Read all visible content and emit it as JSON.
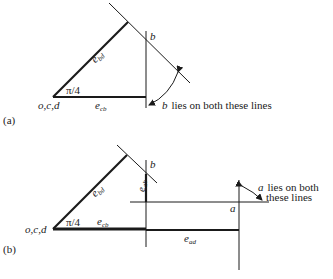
{
  "diagram_a": {
    "panel_label": "(a)",
    "origin_label": "o,c,d",
    "angle_label": "π/4",
    "e_bd": {
      "base": "e",
      "sub": "bd"
    },
    "e_cb": {
      "base": "e",
      "sub": "cb"
    },
    "point_b_label": "b",
    "note_var": "b",
    "note_text": "lies on both these lines"
  },
  "diagram_b": {
    "panel_label": "(b)",
    "origin_label": "o,c,d",
    "angle_label": "π/4",
    "e_bd": {
      "base": "e",
      "sub": "bd"
    },
    "e_cb": {
      "base": "e",
      "sub": "cb"
    },
    "e_ab": {
      "base": "e",
      "sub": "ab"
    },
    "e_ad": {
      "base": "e",
      "sub": "ad"
    },
    "point_b_label": "b",
    "point_a_label": "a",
    "note_var": "a",
    "note_line1": "lies on both",
    "note_line2": "these lines"
  },
  "colors": {
    "ink": "#1a1a1a",
    "background": "#ffffff"
  }
}
